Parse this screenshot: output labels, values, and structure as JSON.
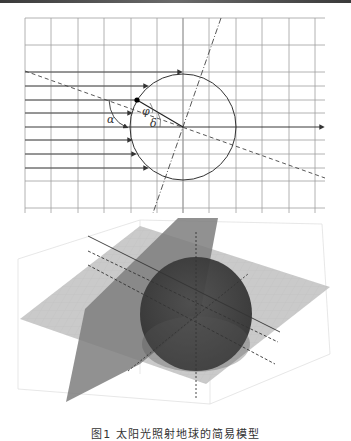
{
  "figure": {
    "caption": "图1  太阳光照射地球的简易模型",
    "top_diagram": {
      "description": "2D cross-section: parallel sunlight rays hitting a circle (Earth), with tilted axis and dashed terminator line",
      "labels": {
        "alpha": "α",
        "phi": "φ",
        "delta": "δ"
      },
      "colors": {
        "grid": "#9a9a9a",
        "line": "#333333",
        "point": "#000000"
      }
    },
    "bottom_diagram": {
      "description": "3D model: sphere (Earth) with intersecting horizontal and tilted planes, parallel rays",
      "colors": {
        "sphere": "#3c3c3c",
        "horizontal_plane": "#c4c4c4",
        "tilted_plane": "#8a8a8a",
        "box": "#d8d8d8"
      }
    }
  }
}
